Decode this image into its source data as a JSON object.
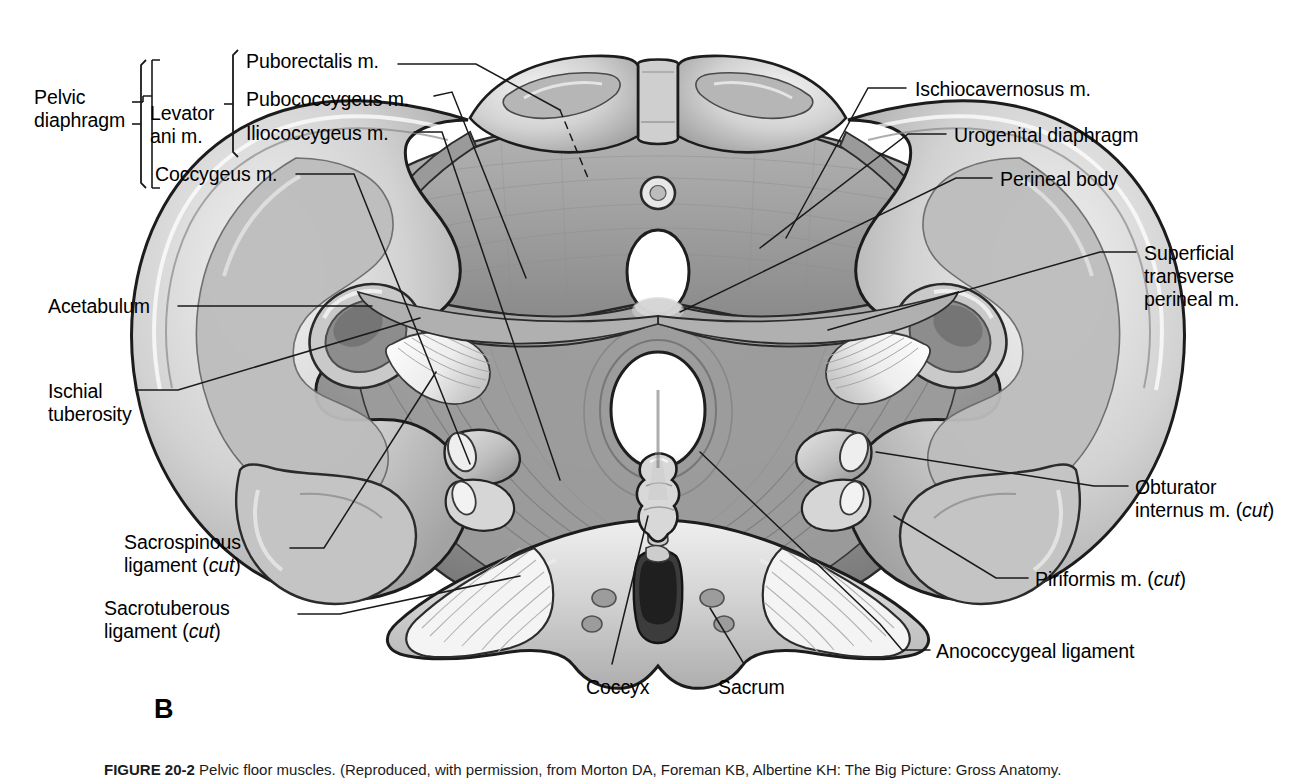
{
  "figure": {
    "panel_letter": "B",
    "caption_number": "FIGURE 20-2",
    "caption_text": "Pelvic floor muscles. (Reproduced, with permission, from Morton DA, Foreman KB, Albertine KH: The Big Picture: Gross Anatomy.",
    "alt": "Inferior view of the female bony pelvis showing the pelvic diaphragm, urogenital diaphragm and perineal musculature"
  },
  "colors": {
    "background": "#ffffff",
    "ink": "#000000",
    "leader_line": "#1a1a1a",
    "bone_light": "#e8e8e8",
    "bone_mid": "#c9c9c9",
    "bone_shadow": "#9a9a9a",
    "muscle_light": "#bdbdbd",
    "muscle_mid": "#9e9e9e",
    "muscle_dark": "#6f6f6f",
    "ligament": "#f1f1f1",
    "orifice": "#ffffff",
    "outline": "#1c1c1c"
  },
  "brackets": {
    "pelvic_diaphragm": "Pelvic\ndiaphragm",
    "levator_ani": "Levator\nani m."
  },
  "labels_left": [
    {
      "id": "pelvic-diaphragm",
      "text": "Pelvic\ndiaphragm",
      "x": 34,
      "y": 88,
      "align": "left"
    },
    {
      "id": "levator-ani",
      "text": "Levator\nani m.",
      "x": 148,
      "y": 104,
      "align": "left"
    },
    {
      "id": "puborectalis",
      "text": "Puborectalis m.",
      "x": 246,
      "y": 50,
      "align": "left"
    },
    {
      "id": "pubococcygeus",
      "text": "Pubococcygeus m.",
      "x": 246,
      "y": 90,
      "align": "left"
    },
    {
      "id": "iliococcygeus",
      "text": "Iliococcygeus m.",
      "x": 246,
      "y": 124,
      "align": "left"
    },
    {
      "id": "coccygeus",
      "text": "Coccygeus m.",
      "x": 155,
      "y": 164,
      "align": "left"
    },
    {
      "id": "acetabulum",
      "text": "Acetabulum",
      "x": 48,
      "y": 297,
      "align": "left"
    },
    {
      "id": "ischial-tuberosity",
      "text": "Ischial\ntuberosity",
      "x": 48,
      "y": 382,
      "align": "left"
    },
    {
      "id": "sacrospinous-ligament",
      "text": "Sacrospinous\nligament (cut)",
      "x": 124,
      "y": 532,
      "align": "left",
      "italic_word": "cut"
    },
    {
      "id": "sacrotuberous-ligament",
      "text": "Sacrotuberous\nligament (cut)",
      "x": 104,
      "y": 598,
      "align": "left",
      "italic_word": "cut"
    }
  ],
  "labels_right": [
    {
      "id": "ischiocavernosus",
      "text": "Ischiocavernosus m.",
      "x": 915,
      "y": 80,
      "align": "left"
    },
    {
      "id": "urogenital-diaphragm",
      "text": "Urogenital diaphragm",
      "x": 954,
      "y": 127,
      "align": "left"
    },
    {
      "id": "perineal-body",
      "text": "Perineal body",
      "x": 1000,
      "y": 170,
      "align": "left"
    },
    {
      "id": "superficial-transverse-perineal",
      "text": "Superficial\ntransverse\nperineal m.",
      "x": 1144,
      "y": 243,
      "align": "left"
    },
    {
      "id": "obturator-internus",
      "text": "Obturator\ninternus m. (cut)",
      "x": 1135,
      "y": 478,
      "align": "left",
      "italic_word": "cut"
    },
    {
      "id": "piriformis",
      "text": "Piriformis m. (cut)",
      "x": 1035,
      "y": 570,
      "align": "left",
      "italic_word": "cut"
    },
    {
      "id": "anococcygeal-ligament",
      "text": "Anococcygeal ligament",
      "x": 936,
      "y": 643,
      "align": "left"
    }
  ],
  "labels_bottom": [
    {
      "id": "coccyx",
      "text": "Coccyx",
      "x": 586,
      "y": 678,
      "align": "left"
    },
    {
      "id": "sacrum",
      "text": "Sacrum",
      "x": 718,
      "y": 678,
      "align": "left"
    }
  ],
  "structures": [
    "pubic symphysis",
    "pubic rami",
    "urogenital diaphragm",
    "urethral orifice",
    "vaginal orifice",
    "anal orifice",
    "levator ani (puborectalis, pubococcygeus, iliococcygeus)",
    "coccygeus muscle",
    "obturator internus muscle (cut)",
    "piriformis muscle (cut)",
    "sacrospinous ligament (cut)",
    "sacrotuberous ligament (cut)",
    "anococcygeal ligament",
    "ischial tuberosity",
    "acetabulum",
    "sacrum",
    "coccyx"
  ]
}
